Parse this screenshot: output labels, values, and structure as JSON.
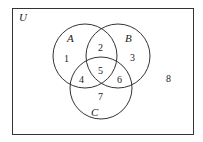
{
  "universe": {
    "label": "U"
  },
  "sets": [
    {
      "label": "A",
      "cx": 85,
      "cy": 56,
      "r": 32
    },
    {
      "label": "B",
      "cx": 118,
      "cy": 56,
      "r": 32
    },
    {
      "label": "C",
      "cx": 101,
      "cy": 88,
      "r": 31
    }
  ],
  "regions": [
    {
      "label": "1",
      "x": 67,
      "y": 62
    },
    {
      "label": "2",
      "x": 101,
      "y": 50
    },
    {
      "label": "3",
      "x": 133,
      "y": 60
    },
    {
      "label": "4",
      "x": 82,
      "y": 82
    },
    {
      "label": "5",
      "x": 101,
      "y": 73
    },
    {
      "label": "6",
      "x": 120,
      "y": 82
    },
    {
      "label": "7",
      "x": 101,
      "y": 100
    },
    {
      "label": "8",
      "x": 169,
      "y": 81
    }
  ],
  "colors": {
    "stroke": "#333333",
    "background": "#ffffff"
  }
}
